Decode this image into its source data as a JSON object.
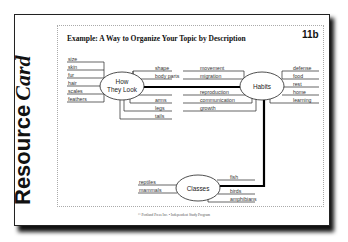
{
  "card": {
    "side_title_bold": "Resource",
    "side_title_italic": "Card",
    "title": "Example: A Way to Organize Your Topic by Description",
    "tag": "11b",
    "footer": "© Portland Press Inc. • Independent Study Program"
  },
  "diagram": {
    "nodes": [
      {
        "id": "how-they-look",
        "label_line1": "How",
        "label_line2": "They Look"
      },
      {
        "id": "habits",
        "label": "Habits"
      },
      {
        "id": "classes",
        "label": "Classes"
      }
    ],
    "how_they_look_left": [
      "size",
      "skin",
      "fur",
      "hair",
      "scales",
      "feathers"
    ],
    "how_they_look_right_top": [
      "shape",
      "body parts"
    ],
    "how_they_look_right_bottom": [
      "arms",
      "legs",
      "tails"
    ],
    "habits_left_top": [
      "movement",
      "migration"
    ],
    "habits_left_bottom": [
      "reproduction",
      "communication",
      "growth"
    ],
    "habits_right": [
      "defense",
      "food",
      "rest",
      "home",
      "learning"
    ],
    "classes_left": [
      "reptiles",
      "mammals"
    ],
    "classes_right_top": [
      "fish"
    ],
    "classes_right_bottom": [
      "birds",
      "amphibians"
    ]
  },
  "colors": {
    "line": "#222222",
    "thick_connector": "#000000",
    "text": "#333333"
  }
}
